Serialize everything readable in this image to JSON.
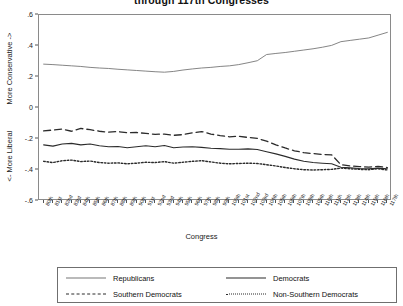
{
  "title": "through 117th Congresses",
  "axis": {
    "x_title": "Congress",
    "y_upper_label": "More Conservative ->",
    "y_lower_label": "<- More Liberal"
  },
  "legend": {
    "republicans": "Republicans",
    "democrats": "Democrats",
    "southern_democrats": "Southern Democrats",
    "non_southern_democrats": "Non-Southern Democrats"
  },
  "chart_data": {
    "type": "line",
    "title": "through 117th Congresses",
    "xlabel": "Congress",
    "ylabel": "<- More Liberal   |   More Conservative ->",
    "ylim": [
      -0.6,
      0.6
    ],
    "yticks": [
      0.6,
      0.4,
      0.2,
      0,
      -0.2,
      -0.4,
      -0.6
    ],
    "ytick_labels": [
      ".6",
      ".4",
      ".2",
      "0",
      "-.2",
      "-.4",
      "-.6"
    ],
    "grid": false,
    "legend_position": "bottom",
    "categories": [
      "80th",
      "81st",
      "82nd",
      "83rd",
      "84th",
      "85th",
      "86th",
      "87th",
      "88th",
      "89th",
      "90th",
      "91st",
      "92nd",
      "93rd",
      "94th",
      "95th",
      "96th",
      "97th",
      "98th",
      "99th",
      "100th",
      "101st",
      "102nd",
      "103rd",
      "104th",
      "105th",
      "106th",
      "107th",
      "108th",
      "109th",
      "110th",
      "111th",
      "112th",
      "113th",
      "114th",
      "115th",
      "116th",
      "117th"
    ],
    "series": [
      {
        "name": "Republicans",
        "style": "solid-thin",
        "color": "#777777",
        "values": [
          0.283,
          0.28,
          0.276,
          0.272,
          0.268,
          0.262,
          0.258,
          0.255,
          0.25,
          0.246,
          0.242,
          0.238,
          0.234,
          0.231,
          0.236,
          0.245,
          0.252,
          0.258,
          0.262,
          0.268,
          0.272,
          0.28,
          0.292,
          0.305,
          0.345,
          0.352,
          0.358,
          0.366,
          0.374,
          0.382,
          0.392,
          0.404,
          0.428,
          0.436,
          0.444,
          0.452,
          0.47,
          0.488
        ]
      },
      {
        "name": "Democrats",
        "style": "solid-thick",
        "color": "#2b2b2b",
        "values": [
          -0.238,
          -0.246,
          -0.232,
          -0.228,
          -0.238,
          -0.232,
          -0.244,
          -0.25,
          -0.248,
          -0.256,
          -0.25,
          -0.244,
          -0.25,
          -0.242,
          -0.256,
          -0.252,
          -0.25,
          -0.254,
          -0.26,
          -0.262,
          -0.266,
          -0.266,
          -0.264,
          -0.268,
          -0.282,
          -0.296,
          -0.312,
          -0.33,
          -0.344,
          -0.352,
          -0.356,
          -0.36,
          -0.382,
          -0.386,
          -0.39,
          -0.392,
          -0.388,
          -0.392
        ]
      },
      {
        "name": "Southern Democrats",
        "style": "dashed",
        "color": "#2b2b2b",
        "values": [
          -0.148,
          -0.142,
          -0.136,
          -0.15,
          -0.132,
          -0.14,
          -0.15,
          -0.156,
          -0.152,
          -0.16,
          -0.158,
          -0.164,
          -0.17,
          -0.168,
          -0.176,
          -0.172,
          -0.16,
          -0.152,
          -0.168,
          -0.178,
          -0.186,
          -0.182,
          -0.19,
          -0.196,
          -0.214,
          -0.238,
          -0.258,
          -0.276,
          -0.288,
          -0.294,
          -0.3,
          -0.302,
          -0.366,
          -0.374,
          -0.378,
          -0.382,
          -0.376,
          -0.384
        ]
      },
      {
        "name": "Non-Southern Democrats",
        "style": "dotted",
        "color": "#2b2b2b",
        "values": [
          -0.344,
          -0.352,
          -0.34,
          -0.336,
          -0.346,
          -0.342,
          -0.352,
          -0.356,
          -0.354,
          -0.36,
          -0.356,
          -0.35,
          -0.352,
          -0.346,
          -0.356,
          -0.35,
          -0.344,
          -0.34,
          -0.348,
          -0.356,
          -0.36,
          -0.358,
          -0.356,
          -0.358,
          -0.366,
          -0.374,
          -0.384,
          -0.392,
          -0.398,
          -0.4,
          -0.398,
          -0.396,
          -0.388,
          -0.392,
          -0.396,
          -0.398,
          -0.392,
          -0.4
        ]
      }
    ]
  }
}
